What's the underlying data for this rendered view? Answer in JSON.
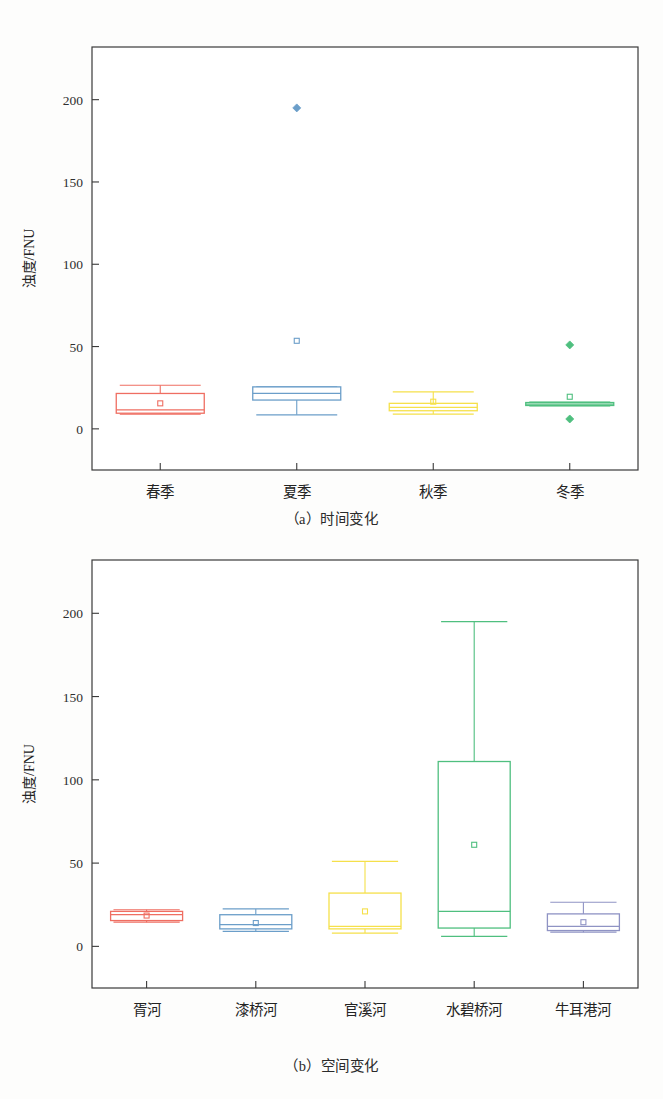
{
  "figure": {
    "ylabel": "浊度/FNU",
    "panels": [
      {
        "key": "a",
        "caption": "（a）时间变化"
      },
      {
        "key": "b",
        "caption": "（b）空间变化"
      }
    ]
  },
  "chart_data": [
    {
      "id": "panel-a",
      "type": "box",
      "title": "（a）时间变化",
      "xlabel": "",
      "ylabel": "浊度/FNU",
      "ylim": [
        -25,
        232
      ],
      "yticks": [
        0,
        50,
        100,
        150,
        200
      ],
      "ytick_labels": [
        "0",
        "50",
        "100",
        "150",
        "200"
      ],
      "grid": false,
      "legend": "none",
      "categories": [
        "春季",
        "夏季",
        "秋季",
        "冬季"
      ],
      "boxes": [
        {
          "category": "春季",
          "color": "#ef6e62",
          "whisker_low": 9.0,
          "q1": 9.5,
          "median": 11.5,
          "q3": 21.5,
          "whisker_high": 26.5,
          "mean": 15.5,
          "outliers": []
        },
        {
          "category": "夏季",
          "color": "#6b9ec9",
          "whisker_low": 8.5,
          "q1": 17.5,
          "median": 21.5,
          "q3": 25.5,
          "whisker_high": 25.5,
          "mean": 53.5,
          "outliers": [
            195.0
          ]
        },
        {
          "category": "秋季",
          "color": "#f5e04a",
          "whisker_low": 9.0,
          "q1": 11.0,
          "median": 13.0,
          "q3": 15.5,
          "whisker_high": 22.5,
          "mean": 16.5,
          "outliers": []
        },
        {
          "category": "冬季",
          "color": "#4fbf7f",
          "whisker_low": 14.0,
          "q1": 14.2,
          "median": 15.0,
          "q3": 16.0,
          "whisker_high": 16.2,
          "mean": 19.5,
          "outliers": [
            51.0,
            6.0
          ]
        }
      ]
    },
    {
      "id": "panel-b",
      "type": "box",
      "title": "（b）空间变化",
      "xlabel": "",
      "ylabel": "浊度/FNU",
      "ylim": [
        -25,
        232
      ],
      "yticks": [
        0,
        50,
        100,
        150,
        200
      ],
      "ytick_labels": [
        "0",
        "50",
        "100",
        "150",
        "200"
      ],
      "grid": false,
      "legend": "none",
      "categories": [
        "胥河",
        "漆桥河",
        "官溪河",
        "水碧桥河",
        "牛耳港河"
      ],
      "boxes": [
        {
          "category": "胥河",
          "color": "#ef6e62",
          "whisker_low": 14.5,
          "q1": 15.5,
          "median": 19.0,
          "q3": 21.0,
          "whisker_high": 22.0,
          "mean": 18.5,
          "outliers": []
        },
        {
          "category": "漆桥河",
          "color": "#6b9ec9",
          "whisker_low": 9.0,
          "q1": 10.5,
          "median": 13.0,
          "q3": 19.0,
          "whisker_high": 22.5,
          "mean": 14.0,
          "outliers": []
        },
        {
          "category": "官溪河",
          "color": "#f5e04a",
          "whisker_low": 8.0,
          "q1": 10.5,
          "median": 12.0,
          "q3": 32.0,
          "whisker_high": 51.0,
          "mean": 21.0,
          "outliers": []
        },
        {
          "category": "水碧桥河",
          "color": "#4fbf7f",
          "whisker_low": 6.0,
          "q1": 11.0,
          "median": 21.0,
          "q3": 111.0,
          "whisker_high": 195.0,
          "mean": 61.0,
          "outliers": []
        },
        {
          "category": "牛耳港河",
          "color": "#8f93c4",
          "whisker_low": 8.5,
          "q1": 9.5,
          "median": 12.0,
          "q3": 19.5,
          "whisker_high": 26.5,
          "mean": 14.5,
          "outliers": []
        }
      ]
    }
  ]
}
